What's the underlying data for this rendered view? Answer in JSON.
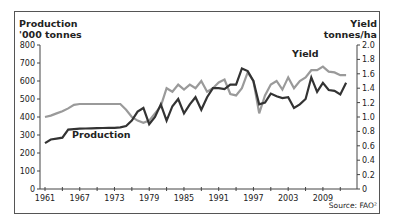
{
  "chart_data": {
    "type": "line",
    "title": "",
    "xlabel": "",
    "ylabel_left": "Production '000 tonnes",
    "ylabel_left_line1": "Production",
    "ylabel_left_line2": "'000 tonnes",
    "ylabel_right": "Yield tonnes/ha",
    "ylabel_right_line1": "Yield",
    "ylabel_right_line2": "tonnes/ha",
    "ylim_left": [
      0,
      800
    ],
    "ylim_right": [
      0,
      2.0
    ],
    "left_ticks": [
      "0",
      "100",
      "200",
      "300",
      "400",
      "500",
      "600",
      "700",
      "800"
    ],
    "right_ticks": [
      "0",
      "0.2",
      "0.4",
      "0.6",
      "0.8",
      "1.0",
      "1.2",
      "1.4",
      "1.6",
      "1.8",
      "2.0"
    ],
    "x_tick_labels": [
      "1961",
      "1967",
      "1973",
      "1979",
      "1985",
      "1991",
      "1997",
      "2003",
      "2009"
    ],
    "grid": false,
    "source": "Source: FAO²",
    "x": [
      1961,
      1962,
      1963,
      1964,
      1965,
      1966,
      1967,
      1968,
      1969,
      1970,
      1971,
      1972,
      1973,
      1974,
      1975,
      1976,
      1977,
      1978,
      1979,
      1980,
      1981,
      1982,
      1983,
      1984,
      1985,
      1986,
      1987,
      1988,
      1989,
      1990,
      1991,
      1992,
      1993,
      1994,
      1995,
      1996,
      1997,
      1998,
      1999,
      2000,
      2001,
      2002,
      2003,
      2004,
      2005,
      2006,
      2007,
      2008,
      2009,
      2010,
      2011,
      2012,
      2013
    ],
    "series": [
      {
        "name": "Production",
        "axis": "left",
        "color": "#333333",
        "label_pos": {
          "x": 72,
          "y": 138
        },
        "values": [
          255,
          275,
          280,
          285,
          330,
          333,
          335,
          336,
          337,
          338,
          339,
          340,
          340,
          342,
          350,
          380,
          430,
          450,
          360,
          400,
          470,
          380,
          460,
          500,
          420,
          470,
          510,
          440,
          510,
          560,
          560,
          555,
          580,
          580,
          670,
          655,
          600,
          470,
          480,
          530,
          515,
          505,
          510,
          450,
          470,
          500,
          620,
          540,
          590,
          550,
          545,
          525,
          590
        ]
      },
      {
        "name": "Yield",
        "axis": "right",
        "color": "#9a9a9a",
        "label_pos": {
          "x": 292,
          "y": 57
        },
        "values": [
          1.0,
          1.02,
          1.05,
          1.08,
          1.12,
          1.17,
          1.18,
          1.18,
          1.18,
          1.18,
          1.18,
          1.18,
          1.18,
          1.18,
          1.1,
          1.0,
          0.95,
          0.92,
          0.95,
          1.05,
          1.15,
          1.4,
          1.35,
          1.45,
          1.38,
          1.45,
          1.4,
          1.5,
          1.35,
          1.4,
          1.48,
          1.52,
          1.32,
          1.3,
          1.4,
          1.62,
          1.5,
          1.05,
          1.3,
          1.45,
          1.5,
          1.38,
          1.55,
          1.4,
          1.5,
          1.55,
          1.65,
          1.65,
          1.7,
          1.63,
          1.62,
          1.58,
          1.58
        ]
      }
    ],
    "legend_position": "inline labels"
  }
}
